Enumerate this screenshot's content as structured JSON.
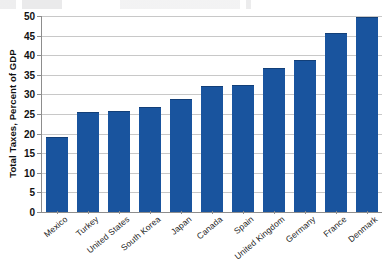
{
  "chart_data": {
    "type": "bar",
    "title": "",
    "xlabel": "",
    "ylabel": "Total Taxes, Percent of GDP",
    "ylim": [
      0,
      50
    ],
    "yticks": [
      0,
      5,
      10,
      15,
      20,
      25,
      30,
      35,
      40,
      45,
      50
    ],
    "grid": true,
    "legend": "none",
    "bar_color": "#19549e",
    "gridline_color": "#c8c8c8",
    "axis_color": "#8d8d8d",
    "categories": [
      "Mexico",
      "Turkey",
      "United States",
      "South Korea",
      "Japan",
      "Canada",
      "Spain",
      "United Kingdom",
      "Germany",
      "France",
      "Denmark"
    ],
    "values": [
      19,
      25.3,
      25.5,
      26.5,
      28.5,
      32,
      32.2,
      36.5,
      38.5,
      45.5,
      49.5
    ]
  }
}
